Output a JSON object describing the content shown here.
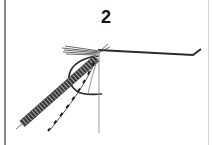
{
  "figure": {
    "step_label": "2",
    "colors": {
      "ink": "#2b2b2b",
      "body": "#3a3a3a",
      "thread": "#9a9a9a",
      "border": "#8a8a8a"
    }
  }
}
